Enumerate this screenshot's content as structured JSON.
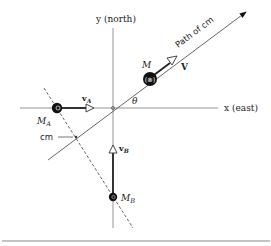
{
  "diagram": {
    "axes": {
      "y_label": "y (north)",
      "x_label": "x (east)"
    },
    "angle_label": "θ",
    "masses": {
      "m_a": {
        "label": "M",
        "subscript": "A",
        "velocity_label": "v",
        "velocity_subscript": "A"
      },
      "m_b": {
        "label": "M",
        "subscript": "B",
        "velocity_label": "v",
        "velocity_subscript": "B"
      },
      "m_total": {
        "label": "M",
        "velocity_label": "V",
        "inner_glyph": "(⊗)"
      }
    },
    "cm_label": "cm",
    "path_label": "Path of cm",
    "colors": {
      "line": "#444444",
      "mass_fill": "#111111",
      "axis": "#777777",
      "rule": "#888888"
    }
  }
}
